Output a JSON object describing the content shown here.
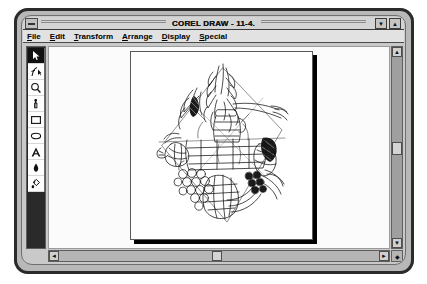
{
  "window": {
    "title": "COREL DRAW - 11-4.",
    "sys_menu_icon": "system-menu-icon",
    "minimize_label": "▼",
    "maximize_label": "▲"
  },
  "menu": {
    "items": [
      {
        "label": "File",
        "accel": "F"
      },
      {
        "label": "Edit",
        "accel": "E"
      },
      {
        "label": "Transform",
        "accel": "T"
      },
      {
        "label": "Arrange",
        "accel": "A"
      },
      {
        "label": "Display",
        "accel": "D"
      },
      {
        "label": "Special",
        "accel": "S"
      }
    ]
  },
  "toolbox": {
    "tools": [
      {
        "name": "pick-tool-icon",
        "label": "Pick",
        "selected": true
      },
      {
        "name": "shape-node-tool-icon",
        "label": "Shape",
        "selected": false
      },
      {
        "name": "zoom-tool-icon",
        "label": "Zoom",
        "selected": false
      },
      {
        "name": "pencil-tool-icon",
        "label": "Pencil",
        "selected": false
      },
      {
        "name": "rectangle-tool-icon",
        "label": "Rectangle",
        "selected": false
      },
      {
        "name": "ellipse-tool-icon",
        "label": "Ellipse",
        "selected": false
      },
      {
        "name": "text-tool-icon",
        "label": "Text",
        "selected": false
      },
      {
        "name": "outline-pen-tool-icon",
        "label": "Outline Pen",
        "selected": false
      },
      {
        "name": "fill-tool-icon",
        "label": "Fill",
        "selected": false
      }
    ]
  },
  "canvas": {
    "artwork_name": "fruit-and-vegetable-wireframe-drawing",
    "page_background": "#ffffff",
    "desktop_background": "#fbfbfb"
  },
  "scrollbars": {
    "vertical": {
      "up_label": "▲",
      "down_label": "▼"
    },
    "horizontal": {
      "left_label": "◄",
      "right_label": "►"
    },
    "corner_label": "◆"
  },
  "colors": {
    "frame": "#2b2b2b",
    "chrome": "#c9c9c9",
    "title_bar": "#d4d4d4",
    "menu_bar": "#e2e2e2",
    "toolbox_background": "#2a2a2a",
    "scrollbar_track": "#9f9f9f"
  }
}
